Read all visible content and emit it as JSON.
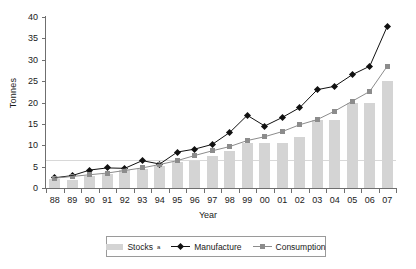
{
  "chart_data": {
    "type": "bar",
    "title": "",
    "xlabel": "Year",
    "ylabel": "Tonnes",
    "ylim": [
      0,
      40
    ],
    "yticks": [
      0,
      5,
      10,
      15,
      20,
      25,
      30,
      35,
      40
    ],
    "grid": false,
    "legend_position": "bottom",
    "categories": [
      "88",
      "89",
      "90",
      "91",
      "92",
      "93",
      "94",
      "95",
      "96",
      "97",
      "98",
      "99",
      "00",
      "01",
      "02",
      "03",
      "04",
      "05",
      "06",
      "07"
    ],
    "series": [
      {
        "name": "Stocks",
        "name_sup": "a",
        "type": "bar",
        "color": "#d4d4d4",
        "values": [
          2.0,
          1.9,
          2.9,
          3.2,
          4.1,
          4.4,
          5.2,
          6.0,
          6.2,
          7.5,
          8.6,
          10.5,
          10.6,
          10.6,
          12.0,
          16.0,
          16.0,
          19.8,
          20.0,
          25.0
        ]
      },
      {
        "name": "Manufacture",
        "type": "line",
        "marker": "diamond",
        "color": "#111111",
        "values": [
          2.4,
          2.9,
          4.2,
          4.7,
          4.6,
          6.4,
          5.6,
          8.4,
          9.1,
          10.2,
          13.0,
          17.0,
          14.5,
          16.5,
          18.8,
          23.0,
          23.8,
          26.5,
          28.5,
          37.8
        ]
      },
      {
        "name": "Consumption",
        "type": "line",
        "marker": "square",
        "color": "#8c8c8c",
        "values": [
          2.3,
          2.7,
          3.1,
          3.5,
          4.1,
          4.7,
          5.5,
          6.4,
          7.6,
          8.7,
          9.7,
          11.1,
          12.0,
          13.2,
          14.8,
          16.0,
          18.0,
          20.3,
          22.6,
          28.5
        ]
      }
    ]
  },
  "legend": {
    "items": [
      {
        "label": "Stocks",
        "sup": "a"
      },
      {
        "label": "Manufacture",
        "sup": ""
      },
      {
        "label": "Consumption",
        "sup": ""
      }
    ]
  }
}
